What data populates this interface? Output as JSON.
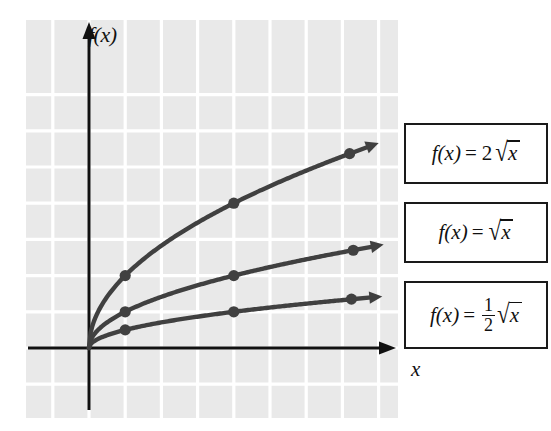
{
  "figure": {
    "background_color": "#ffffff",
    "plot_background_color": "#e9e9e9",
    "gridline_color": "#ffffff",
    "axis_color": "#111111",
    "curve_color": "#404040"
  },
  "axes": {
    "y_label": "f(x)",
    "x_label": "x"
  },
  "legend": {
    "items": [
      {
        "name": "legend-two-sqrt-x",
        "fx": "f(x)",
        "equals": "=",
        "coefficient": "2",
        "radical": "√",
        "radicand": "x",
        "full_text": "f(x) = 2√x",
        "fraction": null
      },
      {
        "name": "legend-sqrt-x",
        "fx": "f(x)",
        "equals": "=",
        "coefficient": "",
        "radical": "√",
        "radicand": "x",
        "full_text": "f(x) = √x",
        "fraction": null
      },
      {
        "name": "legend-half-sqrt-x",
        "fx": "f(x)",
        "equals": "=",
        "coefficient": "",
        "radical": "√",
        "radicand": "x",
        "full_text": "f(x) = 1/2 √x",
        "fraction": {
          "numerator": "1",
          "denominator": "2"
        }
      }
    ]
  },
  "chart_data": {
    "type": "line",
    "title": "",
    "xlabel": "x",
    "ylabel": "f(x)",
    "xlim": [
      -1.75,
      8.5
    ],
    "ylim": [
      -1.7,
      7.35
    ],
    "grid": true,
    "grid_spacing_units": 1,
    "legend_position": "right",
    "axis_arrows": [
      "x-positive",
      "y-positive"
    ],
    "series": [
      {
        "name": "f(x) = 2√x",
        "expression": "2*sqrt(x)",
        "coefficient": 2,
        "color": "#404040",
        "x": [
          0,
          1,
          4,
          7.2
        ],
        "y": [
          0,
          2,
          4,
          5.37
        ],
        "marked_points": [
          [
            1,
            2
          ],
          [
            4,
            4
          ],
          [
            7.2,
            5.37
          ]
        ],
        "end_arrow": true
      },
      {
        "name": "f(x) = √x",
        "expression": "sqrt(x)",
        "coefficient": 1,
        "color": "#404040",
        "x": [
          0,
          1,
          4,
          7.3
        ],
        "y": [
          0,
          1,
          2,
          2.7
        ],
        "marked_points": [
          [
            1,
            1
          ],
          [
            4,
            2
          ],
          [
            7.3,
            2.7
          ]
        ],
        "end_arrow": true
      },
      {
        "name": "f(x) = (1/2)√x",
        "expression": "0.5*sqrt(x)",
        "coefficient": 0.5,
        "color": "#404040",
        "x": [
          0,
          1,
          4,
          7.25
        ],
        "y": [
          0,
          0.5,
          1,
          1.35
        ],
        "marked_points": [
          [
            1,
            0.5
          ],
          [
            4,
            1
          ],
          [
            7.25,
            1.35
          ]
        ],
        "end_arrow": true
      }
    ]
  }
}
